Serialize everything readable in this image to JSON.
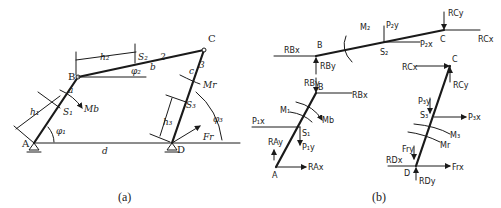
{
  "figure_a": {
    "caption": "(a)",
    "points": {
      "A": "A",
      "B": "B",
      "C": "C",
      "D": "D"
    },
    "links": {
      "link1": "a",
      "link2": "b",
      "link3": "c",
      "ground": "d"
    },
    "link_numbers": {
      "n2": "2",
      "n3": "3"
    },
    "centers": {
      "s1": "S₁",
      "s2": "S₂",
      "s3": "S₃"
    },
    "dims": {
      "h1": "h₁",
      "h2": "h₂",
      "h3": "h₃"
    },
    "angles": {
      "phi1": "φ₁",
      "phi2": "φ₂",
      "phi3": "φ₃"
    },
    "moments": {
      "mb": "Mb",
      "mr": "Mr"
    },
    "force": {
      "fr": "Fr"
    }
  },
  "figure_b": {
    "caption": "(b)",
    "link2": {
      "B": "B",
      "C": "C",
      "S2": "S₂",
      "M2": "M₂",
      "P2y": "P₂y",
      "P2x": "P₂x",
      "RBx": "RBx",
      "RBy": "RBy",
      "RCy": "RCy",
      "RCx": "RCx"
    },
    "link1": {
      "B": "B",
      "A": "A",
      "S1": "S₁",
      "M1": "M₁",
      "Mb": "Mb",
      "P1x": "P₁x",
      "P1y": "P₁y",
      "RBy": "RBy",
      "RBx": "RBx",
      "RAy": "RAy",
      "RAx": "RAx"
    },
    "link3": {
      "C": "C",
      "D": "D",
      "S3": "S₃",
      "M3": "M₃",
      "Mr": "Mr",
      "P3y": "P₃y",
      "P3x": "P₃x",
      "RCx": "RCx",
      "RCy": "RCy",
      "Fry": "Fry",
      "Frx": "Frx",
      "RDx": "RDx",
      "RDy": "RDy"
    }
  }
}
